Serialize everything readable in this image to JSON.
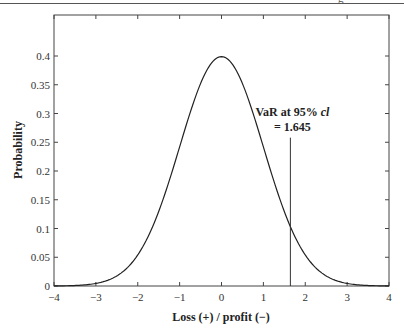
{
  "header": {
    "rule": true,
    "partial_glyph": "g"
  },
  "chart_data": {
    "type": "line",
    "title": "",
    "xlabel": "Loss (+) / profit (−)",
    "ylabel": "Probability",
    "xlim": [
      -4,
      4
    ],
    "ylim": [
      0,
      0.47
    ],
    "x_ticks": [
      -4,
      -3,
      -2,
      -1,
      0,
      1,
      2,
      3,
      4
    ],
    "x_tick_labels": [
      "−4",
      "−3",
      "−2",
      "−1",
      "0",
      "1",
      "2",
      "3",
      "4"
    ],
    "y_ticks": [
      0,
      0.05,
      0.1,
      0.15,
      0.2,
      0.25,
      0.3,
      0.35,
      0.4
    ],
    "y_tick_labels": [
      "0",
      "0.05",
      "0.1",
      "0.15",
      "0.2",
      "0.25",
      "0.3",
      "0.35",
      "0.4"
    ],
    "grid": false,
    "legend": null,
    "series": [
      {
        "name": "Standard normal density",
        "function": "pdf(x) = exp(-x^2/2)/sqrt(2*pi)",
        "x": [
          -4,
          -3.5,
          -3,
          -2.5,
          -2,
          -1.5,
          -1,
          -0.5,
          0,
          0.5,
          1,
          1.5,
          2,
          2.5,
          3,
          3.5,
          4
        ],
        "values": [
          0.0001,
          0.0009,
          0.0044,
          0.0175,
          0.054,
          0.1295,
          0.242,
          0.3521,
          0.3989,
          0.3521,
          0.242,
          0.1295,
          0.054,
          0.0175,
          0.0044,
          0.0009,
          0.0001
        ]
      }
    ],
    "annotations": [
      {
        "type": "vertical_line",
        "x": 1.645,
        "y_top": 0.258,
        "label_line1": "VaR at 95% ",
        "label_italic": "cl",
        "label_line2": "= 1.645"
      }
    ]
  }
}
